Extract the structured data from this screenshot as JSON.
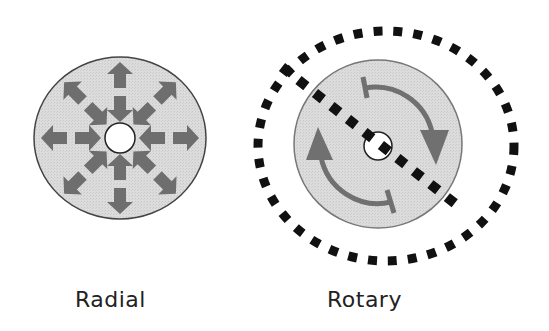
{
  "diagram": {
    "title": "",
    "panels": [
      {
        "id": "radial",
        "label": "Radial",
        "description": "Grey disc with eight double-headed arrows radiating from a small white center hole",
        "arrow_count": 8,
        "arrow_type": "double-headed"
      },
      {
        "id": "rotary",
        "label": "Rotary",
        "description": "Grey disc with two curved arrows indicating rotation, a small white center hole, a dashed diagonal line through the center, and a dashed outer ellipse",
        "curved_arrow_count": 2,
        "dashed_line": "diagonal through center",
        "dashed_outline": "outer ellipse"
      }
    ],
    "colors": {
      "disc_fill": "#d9d9d9",
      "disc_stroke": "#555555",
      "arrow_fill": "#6e6e6e",
      "center_hole_fill": "#ffffff",
      "dash_color": "#111111",
      "label_color": "#222222"
    }
  }
}
